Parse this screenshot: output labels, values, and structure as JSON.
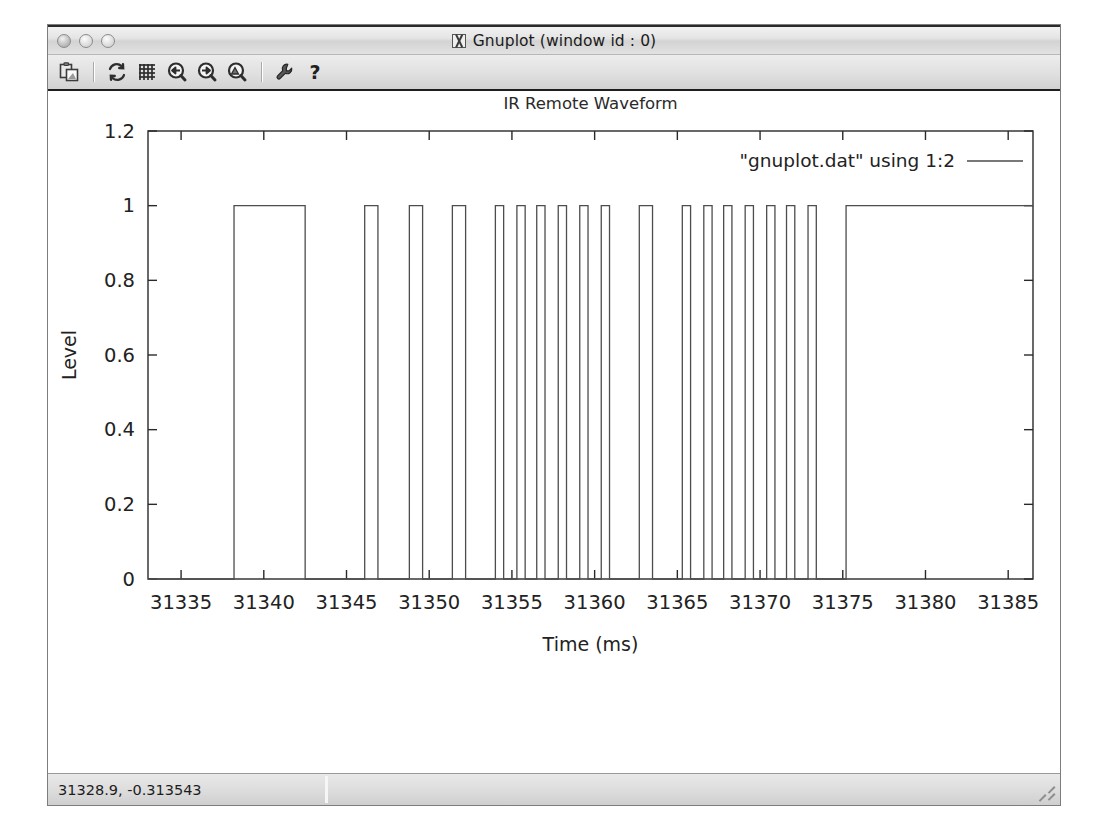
{
  "window": {
    "title": "Gnuplot (window id : 0)",
    "title_icon": "x-window-icon",
    "buttons": [
      {
        "name": "close-button",
        "label": ""
      },
      {
        "name": "minimize-button",
        "label": ""
      },
      {
        "name": "maximize-button",
        "label": ""
      }
    ]
  },
  "toolbar": {
    "items": [
      {
        "name": "copy-to-clipboard-icon",
        "tooltip": "Copy to clipboard"
      },
      {
        "name": "separator",
        "tooltip": ""
      },
      {
        "name": "replot-icon",
        "tooltip": "Replot"
      },
      {
        "name": "grid-icon",
        "tooltip": "Toggle grid"
      },
      {
        "name": "zoom-previous-icon",
        "tooltip": "Previous zoom"
      },
      {
        "name": "zoom-next-icon",
        "tooltip": "Next zoom"
      },
      {
        "name": "autoscale-icon",
        "tooltip": "Autoscale"
      },
      {
        "name": "separator",
        "tooltip": ""
      },
      {
        "name": "settings-wrench-icon",
        "tooltip": "Settings"
      },
      {
        "name": "help-icon",
        "tooltip": "Help"
      }
    ]
  },
  "statusbar": {
    "coordinates": "31328.9, -0.313543",
    "resize_grip": "resize-grip-icon"
  },
  "chart_data": {
    "type": "line",
    "title": "IR Remote Waveform",
    "xlabel": "Time (ms)",
    "ylabel": "Level",
    "xlim": [
      31333.0,
      31386.5
    ],
    "ylim": [
      0,
      1.2
    ],
    "xticks": [
      31335,
      31340,
      31345,
      31350,
      31355,
      31360,
      31365,
      31370,
      31375,
      31380,
      31385
    ],
    "yticks": [
      0,
      0.2,
      0.4,
      0.6,
      0.8,
      1,
      1.2
    ],
    "ytick_labels": [
      "0",
      "0.2",
      "0.4",
      "0.6",
      "0.8",
      "1",
      "1.2"
    ],
    "xtick_labels": [
      "31335",
      "31340",
      "31345",
      "31350",
      "31355",
      "31360",
      "31365",
      "31370",
      "31375",
      "31380",
      "31385"
    ],
    "grid": false,
    "legend": {
      "position": "top-right-inside",
      "entries": [
        {
          "label": "\"gnuplot.dat\" using 1:2",
          "style": "line",
          "color": "#4d4d4d"
        }
      ]
    },
    "series": [
      {
        "name": "\"gnuplot.dat\" using 1:2",
        "color": "#4d4d4d",
        "interpolation": "steps",
        "comment": "Digital IR remote signal: level is 0 or 1; x values in ms. Points are edge transitions.",
        "x": [
          31333.0,
          31338.2,
          31342.5,
          31346.1,
          31346.9,
          31348.8,
          31349.6,
          31351.4,
          31352.2,
          31354.0,
          31354.5,
          31355.3,
          31355.8,
          31356.5,
          31357.0,
          31357.8,
          31358.3,
          31359.1,
          31359.6,
          31360.4,
          31360.9,
          31362.7,
          31363.5,
          31365.3,
          31365.8,
          31366.6,
          31367.1,
          31367.8,
          31368.3,
          31369.1,
          31369.6,
          31370.4,
          31370.9,
          31371.6,
          31372.1,
          31372.9,
          31373.4,
          31375.2,
          31386.5
        ],
        "y": [
          0,
          1,
          0,
          1,
          0,
          1,
          0,
          1,
          0,
          1,
          0,
          1,
          0,
          1,
          0,
          1,
          0,
          1,
          0,
          1,
          0,
          1,
          0,
          1,
          0,
          1,
          0,
          1,
          0,
          1,
          0,
          1,
          0,
          1,
          0,
          1,
          0,
          1,
          1
        ]
      }
    ]
  }
}
